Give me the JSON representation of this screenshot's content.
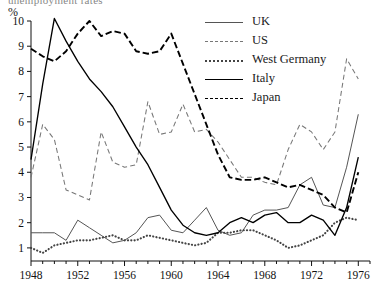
{
  "figure": {
    "cropped_title_fragment": "unemployment rates",
    "unit_label": "%"
  },
  "legend": {
    "position": "top-right",
    "entries": [
      {
        "label": "UK",
        "style": "thin-solid",
        "color": "#555555",
        "key_name": "legend-key-uk"
      },
      {
        "label": "US",
        "style": "dashed",
        "color": "#777777",
        "key_name": "legend-key-us"
      },
      {
        "label": "West Germany",
        "style": "dotted",
        "color": "#444444",
        "key_name": "legend-key-west-germany"
      },
      {
        "label": "Italy",
        "style": "thick-solid",
        "color": "#000000",
        "key_name": "legend-key-italy"
      },
      {
        "label": "Japan",
        "style": "thick-dashed",
        "color": "#000000",
        "key_name": "legend-key-japan"
      }
    ]
  },
  "axes": {
    "y_ticks": [
      "1",
      "2",
      "3",
      "4",
      "5",
      "6",
      "7",
      "8",
      "9",
      "10"
    ],
    "x_ticks": [
      "1948",
      "1952",
      "1956",
      "1960",
      "1964",
      "1968",
      "1972",
      "1976"
    ]
  },
  "chart_data": {
    "type": "line",
    "title": "",
    "xlabel": "",
    "ylabel": "%",
    "xlim": [
      1948,
      1977
    ],
    "ylim": [
      0.3,
      10.3
    ],
    "grid": false,
    "legend_position": "top-right",
    "x": [
      1948,
      1949,
      1950,
      1951,
      1952,
      1953,
      1954,
      1955,
      1956,
      1957,
      1958,
      1959,
      1960,
      1961,
      1962,
      1963,
      1964,
      1965,
      1966,
      1967,
      1968,
      1969,
      1970,
      1971,
      1972,
      1973,
      1974,
      1975,
      1976
    ],
    "series": [
      {
        "name": "UK",
        "values": [
          1.6,
          1.6,
          1.6,
          1.3,
          2.1,
          1.8,
          1.5,
          1.2,
          1.3,
          1.6,
          2.2,
          2.3,
          1.7,
          1.6,
          2.1,
          2.6,
          1.7,
          1.5,
          1.6,
          2.3,
          2.5,
          2.5,
          2.6,
          3.5,
          3.8,
          2.7,
          2.6,
          4.2,
          6.3
        ]
      },
      {
        "name": "US",
        "values": [
          3.8,
          5.9,
          5.3,
          3.3,
          3.1,
          2.9,
          5.6,
          4.4,
          4.2,
          4.3,
          6.8,
          5.5,
          5.6,
          6.7,
          5.6,
          5.7,
          5.2,
          4.5,
          3.8,
          3.8,
          3.6,
          3.5,
          4.9,
          5.9,
          5.6,
          4.9,
          5.6,
          8.5,
          7.7
        ]
      },
      {
        "name": "West Germany",
        "values": [
          1.0,
          0.8,
          1.1,
          1.2,
          1.3,
          1.3,
          1.4,
          1.5,
          1.3,
          1.3,
          1.5,
          1.4,
          1.3,
          1.2,
          1.1,
          1.2,
          1.6,
          1.6,
          1.7,
          1.7,
          1.5,
          1.3,
          1.0,
          1.1,
          1.3,
          1.5,
          2.0,
          2.2,
          2.1
        ]
      },
      {
        "name": "Italy",
        "values": [
          4.5,
          7.5,
          10.1,
          9.2,
          8.4,
          7.7,
          7.2,
          6.6,
          5.8,
          5.0,
          4.3,
          3.4,
          2.5,
          1.9,
          1.6,
          1.5,
          1.6,
          2.0,
          2.2,
          2.0,
          2.3,
          2.4,
          2.0,
          2.0,
          2.3,
          2.1,
          1.5,
          2.6,
          4.6
        ]
      },
      {
        "name": "Japan",
        "values": [
          8.9,
          8.6,
          8.4,
          8.8,
          9.5,
          10.0,
          9.4,
          9.6,
          9.5,
          8.8,
          8.7,
          8.8,
          9.5,
          8.3,
          7.1,
          5.9,
          4.7,
          3.8,
          3.7,
          3.7,
          3.8,
          3.6,
          3.4,
          3.5,
          3.3,
          3.1,
          2.6,
          2.4,
          4.0
        ]
      }
    ]
  }
}
